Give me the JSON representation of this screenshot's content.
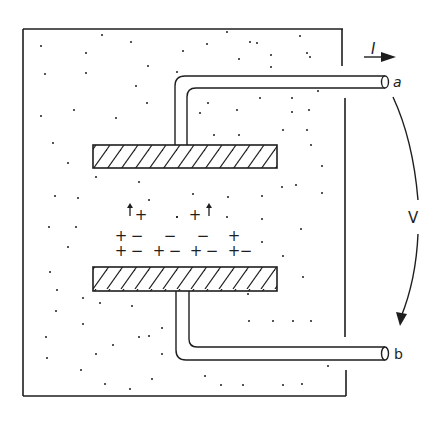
{
  "diagram": {
    "colors": {
      "ink": "#1e1e1e",
      "background": "#ffffff"
    },
    "labels": {
      "current": "I",
      "terminal_top": "a",
      "terminal_bottom": "b",
      "voltage": "V"
    },
    "charges": {
      "row1": [
        "+",
        "+"
      ],
      "row2": [
        "+",
        "−",
        "−",
        "−",
        "+"
      ],
      "row3": [
        "+",
        "−",
        "+",
        "−",
        "+",
        "−",
        "+",
        "−"
      ]
    },
    "components": [
      "outer-medium-box",
      "top-plate",
      "bottom-plate",
      "top-lead-wire",
      "bottom-lead-wire",
      "current-arrow",
      "voltage-arrow"
    ]
  }
}
